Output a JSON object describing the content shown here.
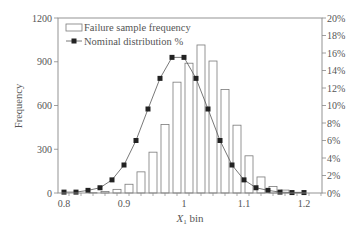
{
  "chart_data": {
    "type": "bar",
    "title": "",
    "xlabel": "X1 bin",
    "xlabel_main": "X",
    "xlabel_sub": "1",
    "xlabel_rest": " bin",
    "ylabel": "Frequency",
    "y2label": "",
    "xlim": [
      0.79,
      1.23
    ],
    "ylim": [
      0,
      1200
    ],
    "y2lim": [
      0,
      20
    ],
    "x_ticks": [
      "0.8",
      "0.9",
      "1",
      "1.1",
      "1.2"
    ],
    "y_ticks": [
      "0",
      "300",
      "600",
      "900",
      "1200"
    ],
    "y2_ticks": [
      "0%",
      "2%",
      "4%",
      "6%",
      "8%",
      "10%",
      "12%",
      "14%",
      "16%",
      "18%",
      "20%"
    ],
    "grid": false,
    "legend_position": "upper-left",
    "categories": [
      0.8,
      0.82,
      0.84,
      0.86,
      0.88,
      0.9,
      0.92,
      0.94,
      0.96,
      0.98,
      1.0,
      1.02,
      1.04,
      1.06,
      1.08,
      1.1,
      1.12,
      1.14,
      1.16,
      1.18,
      1.2
    ],
    "series": [
      {
        "name": "Failure sample frequency",
        "type": "bar",
        "axis": "left",
        "values": [
          0,
          0,
          2,
          10,
          25,
          60,
          145,
          280,
          470,
          760,
          890,
          1015,
          905,
          710,
          465,
          255,
          110,
          45,
          20,
          5,
          0
        ]
      },
      {
        "name": "Nominal distribution %",
        "type": "line",
        "axis": "right",
        "values": [
          0.1,
          0.1,
          0.3,
          0.6,
          1.5,
          3.2,
          6.0,
          9.6,
          13.1,
          15.5,
          15.5,
          13.1,
          9.6,
          6.0,
          3.2,
          1.5,
          0.6,
          0.3,
          0.1,
          0.05,
          0.05
        ]
      }
    ]
  },
  "colors": {
    "axis": "#888888",
    "bar_edge": "#7a7a7a",
    "bar_fill": "#ffffff",
    "line": "#555555",
    "marker": "#222222",
    "text": "#555555"
  }
}
